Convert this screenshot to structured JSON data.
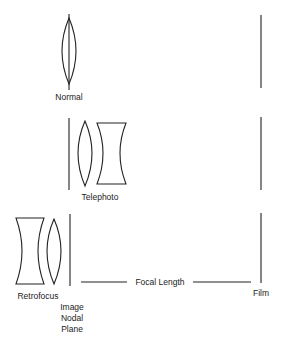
{
  "diagram": {
    "type": "lens-configuration-comparison",
    "rows": [
      {
        "name": "Normal",
        "label": "Normal",
        "elements": [
          "converging-lens"
        ],
        "film_position": "right"
      },
      {
        "name": "Telephoto",
        "label": "Telephoto",
        "elements": [
          "converging-lens",
          "diverging-lens"
        ],
        "film_position": "right"
      },
      {
        "name": "Retrofocus",
        "label": "Retrofocus",
        "elements": [
          "diverging-lens",
          "converging-lens"
        ],
        "film_position": "right"
      }
    ],
    "labels": {
      "normal": "Normal",
      "telephoto": "Telephoto",
      "retrofocus": "Retrofocus",
      "focal_length": "Focal Length",
      "film": "Film",
      "image_nodal_plane": [
        "Image",
        "Nodal",
        "Plane"
      ]
    },
    "colors": {
      "stroke": "#222222",
      "background": "#ffffff"
    }
  }
}
